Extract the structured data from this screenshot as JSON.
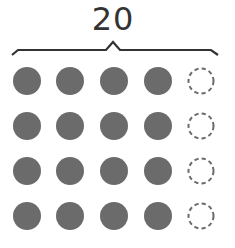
{
  "diagram": {
    "total_label": "20",
    "rows": 4,
    "columns": 5,
    "filled_per_row": 4,
    "empty_per_row": 1,
    "filled_count": 16,
    "empty_count": 4,
    "colors": {
      "filled": "#6b6b6b",
      "empty_stroke": "#6b6b6b",
      "brace": "#333333",
      "label": "#333333"
    },
    "grid": {
      "col_x": [
        27,
        70,
        114,
        158,
        201
      ],
      "row_y": [
        81,
        126,
        171,
        216
      ],
      "radius": 14
    }
  }
}
